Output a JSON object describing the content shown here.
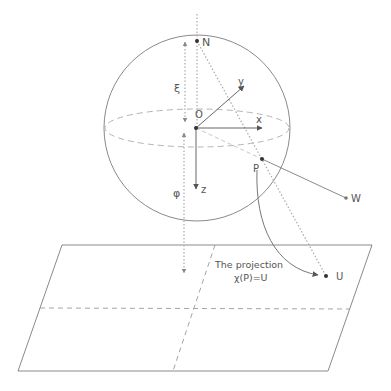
{
  "diagram": {
    "colors": {
      "line": "#8a8a8a",
      "dashed": "#b5b5b5",
      "text": "#555555",
      "point": "#333333"
    },
    "labels": {
      "north": "N",
      "origin": "O",
      "x_axis": "x",
      "y_axis": "y",
      "z_axis": "z",
      "xi": "ξ",
      "phi": "φ",
      "point_p": "P",
      "point_w": "W",
      "point_u": "U",
      "projection_line1": "The projection",
      "projection_line2": "χ(P)=U"
    },
    "elements": {
      "sphere": {
        "cx": 197,
        "cy": 128,
        "r": 93
      },
      "equator": {
        "cx": 197,
        "cy": 128,
        "rx": 92,
        "ry": 19
      },
      "plane": {
        "corners": [
          [
            62,
            245
          ],
          [
            372,
            245
          ],
          [
            328,
            371
          ],
          [
            18,
            371
          ]
        ]
      },
      "points": {
        "N": [
          197,
          41
        ],
        "O": [
          196,
          128
        ],
        "P": [
          262,
          159
        ],
        "W": [
          346,
          198
        ],
        "U": [
          326,
          276
        ]
      }
    }
  }
}
